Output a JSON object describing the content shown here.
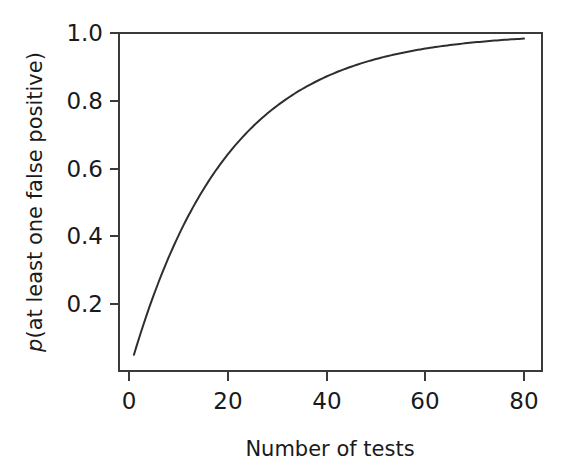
{
  "chart_data": {
    "type": "line",
    "title": "",
    "subtitle": "",
    "xlabel": "Number of tests",
    "ylabel": "p(at least one false positive)",
    "ylabel_italic_prefix": "p",
    "ylabel_rest": "(at least one false positive)",
    "xlim": [
      0,
      84
    ],
    "ylim": [
      0.03,
      1.02
    ],
    "grid": false,
    "legend": "none",
    "xticks": [
      0,
      20,
      40,
      60,
      80
    ],
    "xtick_labels": [
      "0",
      "20",
      "40",
      "60",
      "80"
    ],
    "yticks": [
      0.2,
      0.4,
      0.6,
      0.8,
      1.0
    ],
    "ytick_labels": [
      "0.2",
      "0.4",
      "0.6",
      "0.8",
      "1.0"
    ],
    "series": [
      {
        "name": "p(at least one false positive)",
        "formula": "1 - (1 - 0.05)^n",
        "alpha": 0.05,
        "color": "#2e2e2e",
        "x": [
          1,
          2,
          3,
          4,
          5,
          6,
          7,
          8,
          9,
          10,
          12,
          14,
          16,
          18,
          20,
          22,
          24,
          26,
          28,
          30,
          32,
          34,
          36,
          38,
          40,
          44,
          48,
          52,
          56,
          60,
          64,
          68,
          72,
          76,
          80
        ],
        "values": [
          0.05,
          0.098,
          0.143,
          0.185,
          0.226,
          0.265,
          0.302,
          0.337,
          0.37,
          0.401,
          0.46,
          0.512,
          0.56,
          0.603,
          0.642,
          0.677,
          0.708,
          0.736,
          0.762,
          0.785,
          0.806,
          0.825,
          0.842,
          0.857,
          0.871,
          0.895,
          0.915,
          0.931,
          0.944,
          0.954,
          0.963,
          0.97,
          0.976,
          0.98,
          0.984
        ]
      }
    ],
    "annotations": []
  },
  "axes": {
    "x_axis_name": "Number of tests",
    "y_axis_name": "p(at least one false positive)"
  },
  "colors": {
    "curve": "#2e2e2e",
    "axis": "#3a3a3a",
    "background": "#ffffff",
    "text": "#1a1a1a"
  }
}
